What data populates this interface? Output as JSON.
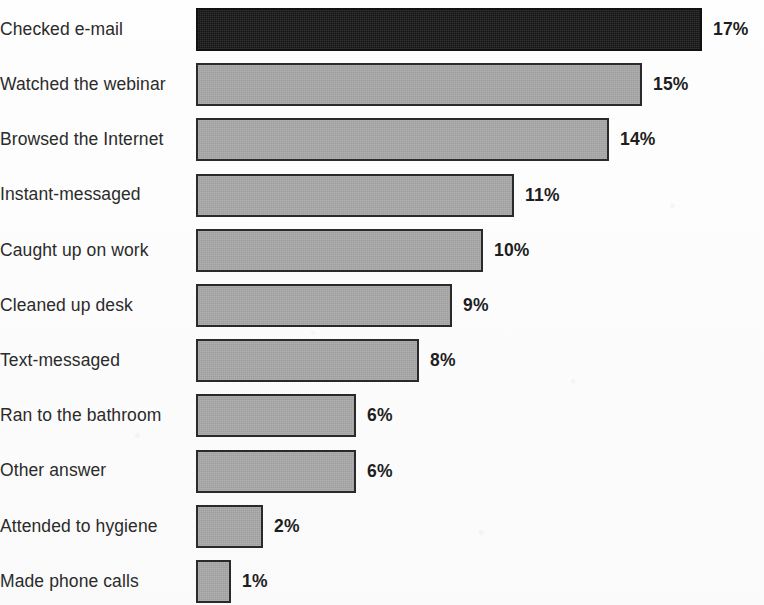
{
  "chart_data": {
    "type": "bar",
    "orientation": "horizontal",
    "title": "",
    "subtitle": "",
    "xlabel": "",
    "ylabel": "",
    "grid": false,
    "legend": null,
    "value_suffix": "%",
    "xlim": [
      0,
      17
    ],
    "categories": [
      "Checked e-mail",
      "Watched the webinar",
      "Browsed the Internet",
      "Instant-messaged",
      "Caught up on work",
      "Cleaned up desk",
      "Text-messaged",
      "Ran to the bathroom",
      "Other answer",
      "Attended to hygiene",
      "Made phone calls"
    ],
    "values": [
      17,
      15,
      14,
      11,
      10,
      9,
      8,
      6,
      6,
      2,
      1
    ],
    "value_labels": [
      "17%",
      "15%",
      "14%",
      "11%",
      "10%",
      "9%",
      "8%",
      "6%",
      "6%",
      "2%",
      "1%"
    ],
    "bar_pixel_widths": [
      506,
      446,
      413,
      318,
      287,
      256,
      223,
      160,
      160,
      67,
      35
    ],
    "row_tops": [
      5,
      68,
      131,
      194,
      257,
      320,
      383,
      446,
      509,
      509,
      560
    ],
    "highlighted_index": 0,
    "colors": {
      "bar_fill": "#a9a9a9",
      "bar_border": "#2a2a2a",
      "highlight_fill": "#181818",
      "highlight_border": "#111111",
      "label_text": "#2b2b2b",
      "value_text": "#1e1e1e",
      "background": "#fdfdfd"
    }
  }
}
